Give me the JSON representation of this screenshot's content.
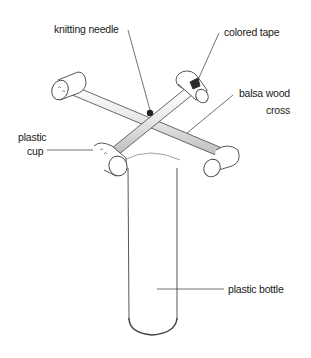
{
  "diagram": {
    "labels": {
      "knitting_needle": "knitting needle",
      "colored_tape": "colored tape",
      "balsa_wood_line1": "balsa wood",
      "balsa_wood_line2": "cross",
      "plastic_cup_line1": "plastic",
      "plastic_cup_line2": "cup",
      "plastic_bottle": "plastic bottle"
    },
    "colors": {
      "line": "#333333",
      "tape": "#2a2a2a",
      "background": "#ffffff"
    }
  }
}
